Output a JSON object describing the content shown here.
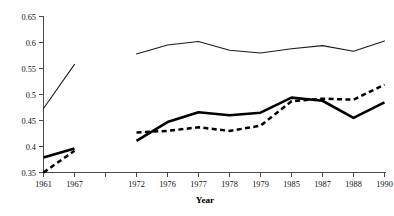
{
  "chart_data": {
    "type": "line",
    "title": "",
    "xlabel": "Year",
    "ylabel": "",
    "categories": [
      "1961",
      "1967",
      "",
      "1972",
      "1976",
      "1977",
      "1978",
      "1979",
      "1985",
      "1987",
      "1988",
      "1990"
    ],
    "xtick_labels": [
      "1961",
      "1967",
      "1972",
      "1976",
      "1977",
      "1978",
      "1979",
      "1985",
      "1987",
      "1988",
      "1990"
    ],
    "ytick_labels": [
      "0.35",
      "0.4",
      "0.45",
      "0.5",
      "0.55",
      "0.6",
      "0.65"
    ],
    "ytick_values": [
      0.35,
      0.4,
      0.45,
      0.5,
      0.55,
      0.6,
      0.65
    ],
    "ylim": [
      0.35,
      0.65
    ],
    "grid": false,
    "legend": "none",
    "note": "Series are drawn in two disconnected spans: 1961-1967 and 1972-1990, separated by an unlabeled gap tick.",
    "series": [
      {
        "name": "thin-line",
        "style": "thin-solid",
        "color": "#1a1a1a",
        "segments": [
          {
            "x": [
              "1961",
              "1967"
            ],
            "values": [
              0.473,
              0.558
            ]
          },
          {
            "x": [
              "1972",
              "1976",
              "1977",
              "1978",
              "1979",
              "1985",
              "1987",
              "1988",
              "1990"
            ],
            "values": [
              0.578,
              0.595,
              0.602,
              0.585,
              0.58,
              0.588,
              0.594,
              0.583,
              0.603
            ]
          }
        ]
      },
      {
        "name": "thick-line",
        "style": "thick-solid",
        "color": "#000000",
        "segments": [
          {
            "x": [
              "1961",
              "1967"
            ],
            "values": [
              0.379,
              0.396
            ]
          },
          {
            "x": [
              "1972",
              "1976",
              "1977",
              "1978",
              "1979",
              "1985",
              "1987",
              "1988",
              "1990"
            ],
            "values": [
              0.411,
              0.447,
              0.466,
              0.46,
              0.465,
              0.494,
              0.488,
              0.455,
              0.485
            ]
          }
        ]
      },
      {
        "name": "dashed-line",
        "style": "thick-dashed",
        "color": "#000000",
        "segments": [
          {
            "x": [
              "1961",
              "1967"
            ],
            "values": [
              0.35,
              0.392
            ]
          },
          {
            "x": [
              "1972",
              "1976",
              "1977",
              "1978",
              "1979",
              "1985",
              "1987",
              "1988",
              "1990"
            ],
            "values": [
              0.427,
              0.43,
              0.437,
              0.43,
              0.44,
              0.487,
              0.492,
              0.49,
              0.519
            ]
          }
        ]
      }
    ]
  },
  "axes": {
    "x_title": "Year",
    "y_labels": [
      "0.65",
      "0.6",
      "0.55",
      "0.5",
      "0.45",
      "0.4",
      "0.35"
    ],
    "x_labels": [
      "1961",
      "1967",
      "1972",
      "1976",
      "1977",
      "1978",
      "1979",
      "1985",
      "1987",
      "1988",
      "1990"
    ]
  }
}
